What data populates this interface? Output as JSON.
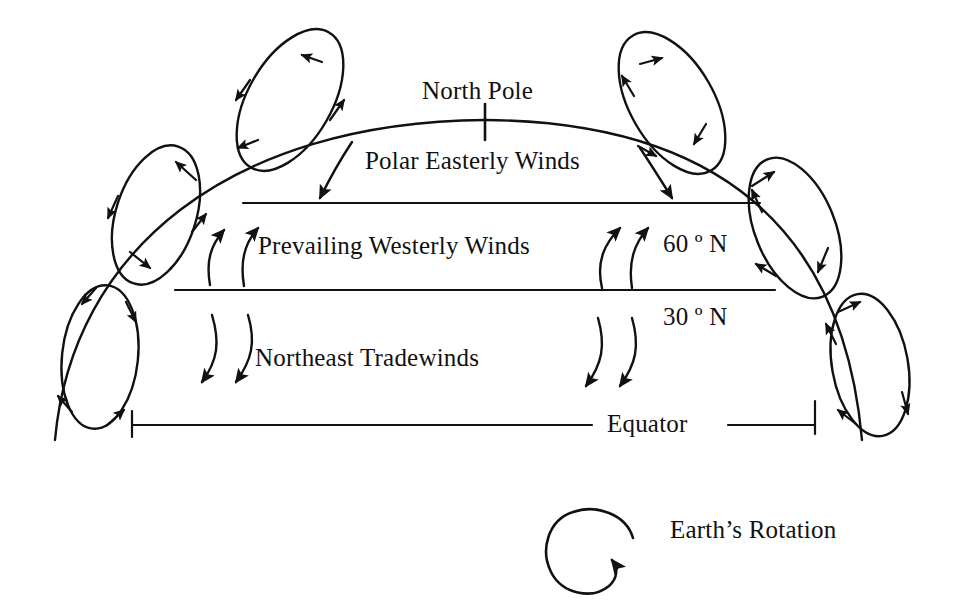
{
  "figure": {
    "kind": "global-atmospheric-circulation-diagram",
    "background_color": "#ffffff",
    "ink_color": "#111111"
  },
  "labels": {
    "north_pole": "North Pole",
    "polar_easterly_winds": "Polar Easterly Winds",
    "prevailing_westerly_winds": "Prevailing Westerly Winds",
    "northeast_tradewinds": "Northeast Tradewinds",
    "latitude_60n": "60 º N",
    "latitude_30n": "30 º N",
    "equator": "Equator",
    "earths_rotation": "Earth’s Rotation"
  },
  "diagram_data": {
    "type": "schematic",
    "hemisphere_arc": {
      "description": "Curved arc representing the northern hemisphere surface of the Earth",
      "apex_x": 485,
      "apex_y": 120,
      "left_end_x": 55,
      "right_end_y": 440
    },
    "latitude_lines": [
      {
        "name": "60 º N",
        "y": 203,
        "x_start": 243,
        "x_end": 760
      },
      {
        "name": "30 º N",
        "y": 290,
        "x_start": 175,
        "x_end": 775
      },
      {
        "name": "Equator",
        "y": 425,
        "x_start": 132,
        "x_end": 815,
        "has_gap_for_label": true
      }
    ],
    "circulation_cells": [
      {
        "name": "polar-cell-left",
        "cx": 290,
        "cy": 100,
        "rx": 42,
        "ry": 78,
        "rotation_deg": 30,
        "arrowheads": 4
      },
      {
        "name": "ferrel-cell-left",
        "cx": 156,
        "cy": 215,
        "rx": 40,
        "ry": 72,
        "rotation_deg": 18,
        "arrowheads": 4
      },
      {
        "name": "hadley-cell-left",
        "cx": 100,
        "cy": 357,
        "rx": 38,
        "ry": 72,
        "rotation_deg": 6,
        "arrowheads": 4
      },
      {
        "name": "polar-cell-right",
        "cx": 672,
        "cy": 103,
        "rx": 42,
        "ry": 78,
        "rotation_deg": -30,
        "arrowheads": 4
      },
      {
        "name": "ferrel-cell-right",
        "cx": 795,
        "cy": 228,
        "rx": 40,
        "ry": 74,
        "rotation_deg": -22,
        "arrowheads": 4
      },
      {
        "name": "hadley-cell-right",
        "cx": 870,
        "cy": 365,
        "rx": 38,
        "ry": 72,
        "rotation_deg": -10,
        "arrowheads": 4
      }
    ],
    "wind_arrow_groups": [
      {
        "name": "polar-easterlies",
        "count": 2,
        "direction": "downward onto 60 N line",
        "side": "both"
      },
      {
        "name": "prevailing-westerlies-left",
        "count": 2,
        "direction": "upward-right",
        "side": "left"
      },
      {
        "name": "prevailing-westerlies-right",
        "count": 2,
        "direction": "upward-right",
        "side": "right"
      },
      {
        "name": "northeast-tradewinds-left",
        "count": 2,
        "direction": "downward-left",
        "side": "left"
      },
      {
        "name": "northeast-tradewinds-right",
        "count": 2,
        "direction": "downward-left",
        "side": "right"
      }
    ],
    "rotation_symbol": {
      "name": "earths-rotation-arrow",
      "cx": 598,
      "cy": 557,
      "direction": "counterclockwise"
    }
  }
}
